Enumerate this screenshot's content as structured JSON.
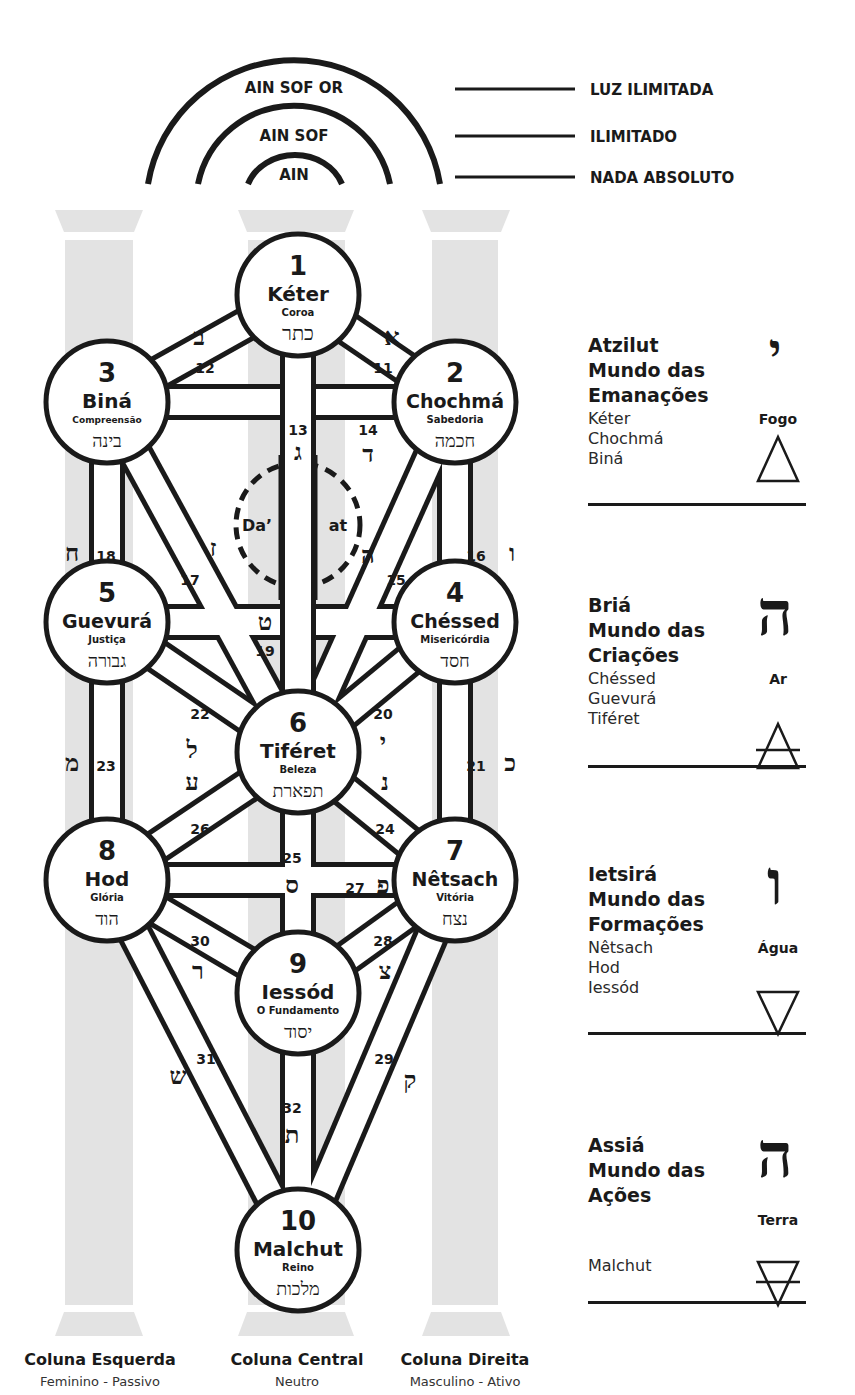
{
  "ain_levels": [
    {
      "arc_label": "AIN SOF OR",
      "meaning": "LUZ ILIMITADA"
    },
    {
      "arc_label": "AIN SOF",
      "meaning": "ILIMITADO"
    },
    {
      "arc_label": "AIN",
      "meaning": "NADA ABSOLUTO"
    }
  ],
  "sefirot": [
    {
      "number": "1",
      "name": "Kéter",
      "meaning": "Coroa",
      "hebrew": "כתר"
    },
    {
      "number": "2",
      "name": "Chochmá",
      "meaning": "Sabedoria",
      "hebrew": "חכמה"
    },
    {
      "number": "3",
      "name": "Biná",
      "meaning": "Compreensão",
      "hebrew": "בינה"
    },
    {
      "number": "4",
      "name": "Chéssed",
      "meaning": "Misericórdia",
      "hebrew": "חסד"
    },
    {
      "number": "5",
      "name": "Guevurá",
      "meaning": "Justiça",
      "hebrew": "גבורה"
    },
    {
      "number": "6",
      "name": "Tiféret",
      "meaning": "Beleza",
      "hebrew": "תפארת"
    },
    {
      "number": "7",
      "name": "Nêtsach",
      "meaning": "Vitória",
      "hebrew": "נצח"
    },
    {
      "number": "8",
      "name": "Hod",
      "meaning": "Glória",
      "hebrew": "הוד"
    },
    {
      "number": "9",
      "name": "Iessód",
      "meaning": "O Fundamento",
      "hebrew": "יסוד"
    },
    {
      "number": "10",
      "name": "Malchut",
      "meaning": "Reino",
      "hebrew": "מלכות"
    }
  ],
  "daat": {
    "left": "Da’",
    "right": "at"
  },
  "paths": [
    {
      "number": "11",
      "letter": "א"
    },
    {
      "number": "12",
      "letter": "ב"
    },
    {
      "number": "13",
      "letter": "ג"
    },
    {
      "number": "14",
      "letter": "ד"
    },
    {
      "number": "15",
      "letter": "ה"
    },
    {
      "number": "16",
      "letter": "ו"
    },
    {
      "number": "17",
      "letter": "ז"
    },
    {
      "number": "18",
      "letter": "ח"
    },
    {
      "number": "19",
      "letter": "ט"
    },
    {
      "number": "20",
      "letter": "י"
    },
    {
      "number": "21",
      "letter": "כ"
    },
    {
      "number": "22",
      "letter": "ל"
    },
    {
      "number": "23",
      "letter": "מ"
    },
    {
      "number": "24",
      "letter": "נ"
    },
    {
      "number": "25",
      "letter": "ס"
    },
    {
      "number": "26",
      "letter": "ע"
    },
    {
      "number": "27",
      "letter": "פ"
    },
    {
      "number": "28",
      "letter": "צ"
    },
    {
      "number": "29",
      "letter": "ק"
    },
    {
      "number": "30",
      "letter": "ר"
    },
    {
      "number": "31",
      "letter": "ש"
    },
    {
      "number": "32",
      "letter": "ת"
    }
  ],
  "worlds": [
    {
      "title_lines": [
        "Atzilut",
        "Mundo das",
        "Emanações"
      ],
      "sefirot": [
        "Kéter",
        "Chochmá",
        "Biná"
      ],
      "element": "Fogo",
      "letter": "י",
      "symbol": "fire-triangle"
    },
    {
      "title_lines": [
        "Briá",
        "Mundo das",
        "Criações"
      ],
      "sefirot": [
        "Chéssed",
        "Guevurá",
        "Tiféret"
      ],
      "element": "Ar",
      "letter": "ה",
      "symbol": "air-triangle"
    },
    {
      "title_lines": [
        "Ietsirá",
        "Mundo das",
        "Formações"
      ],
      "sefirot": [
        "Nêtsach",
        "Hod",
        "Iessód"
      ],
      "element": "Água",
      "letter": "ו",
      "symbol": "water-triangle"
    },
    {
      "title_lines": [
        "Assiá",
        "Mundo das",
        "Ações"
      ],
      "sefirot": [
        "Malchut"
      ],
      "element": "Terra",
      "letter": "ה",
      "symbol": "earth-triangle"
    }
  ],
  "columns": [
    {
      "name": "Coluna Esquerda",
      "description": "Feminino - Passivo"
    },
    {
      "name": "Coluna Central",
      "description": "Neutro"
    },
    {
      "name": "Coluna Direita",
      "description": "Masculino - Ativo"
    }
  ],
  "colors": {
    "ink": "#1a1a1a",
    "pillar": "#e3e3e3",
    "background": "#ffffff"
  }
}
